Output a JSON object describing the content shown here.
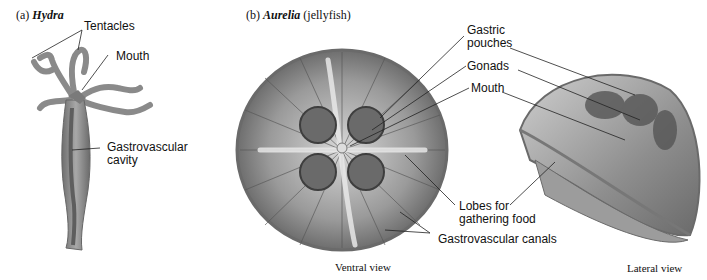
{
  "panels": {
    "a": {
      "prefix": "(a) ",
      "name": "Hydra"
    },
    "b": {
      "prefix": "(b) ",
      "name": "Aurelia",
      "suffix": " (jellyfish)"
    }
  },
  "labels": {
    "tentacles": "Tentacles",
    "mouth_hydra": "Mouth",
    "gv_cavity_1": "Gastrovascular",
    "gv_cavity_2": "cavity",
    "gastric_pouches_1": "Gastric",
    "gastric_pouches_2": "pouches",
    "gonads": "Gonads",
    "mouth_aurelia": "Mouth",
    "lobes_1": "Lobes for",
    "lobes_2": "gathering food",
    "gv_canals": "Gastrovascular canals"
  },
  "captions": {
    "ventral": "Ventral view",
    "lateral": "Lateral view"
  },
  "colors": {
    "tissue": "#8a8a8a",
    "tissue_dark": "#5a5a5a",
    "tissue_light": "#c4c4c4",
    "leader": "#222222"
  }
}
